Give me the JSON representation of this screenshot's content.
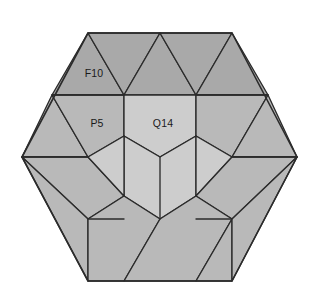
{
  "figure": {
    "kind": "hexagon-tiling-diagram",
    "background_color": "#ffffff",
    "outline_color": "#2b2b2b",
    "width": 318,
    "height": 301
  },
  "palette": {
    "dark_gray": "#a9a9a9",
    "mid_gray": "#b9b9b9",
    "light_gray": "#cdcdcd",
    "stroke": "#2b2b2b"
  },
  "hexagon": {
    "vertices": [
      {
        "x": 22,
        "y": 157
      },
      {
        "x": 88,
        "y": 33
      },
      {
        "x": 232,
        "y": 33
      },
      {
        "x": 297,
        "y": 157
      },
      {
        "x": 232,
        "y": 281
      },
      {
        "x": 88,
        "y": 281
      }
    ]
  },
  "labels": [
    {
      "id": "label-f10",
      "text": "F10",
      "x": 94,
      "y": 74
    },
    {
      "id": "label-p5",
      "text": "P5",
      "x": 97,
      "y": 124
    },
    {
      "id": "label-q14",
      "text": "Q14",
      "x": 163,
      "y": 124
    }
  ],
  "cells": [
    {
      "id": "cell-top-1",
      "name": "top-triangle-left",
      "shade": "dark_gray",
      "points": "88,33 124,95 52,95"
    },
    {
      "id": "cell-top-2",
      "name": "top-triangle-left-center",
      "shade": "dark_gray",
      "points": "88,33 160,33 124,95"
    },
    {
      "id": "cell-top-3",
      "name": "top-triangle-center",
      "shade": "dark_gray",
      "points": "160,33 196,95 124,95"
    },
    {
      "id": "cell-top-4",
      "name": "top-triangle-right-center",
      "shade": "dark_gray",
      "points": "160,33 232,33 196,95"
    },
    {
      "id": "cell-top-5",
      "name": "top-triangle-right",
      "shade": "dark_gray",
      "points": "232,33 268,95 196,95"
    },
    {
      "id": "cell-left-upper-tri",
      "name": "left-upper-triangle",
      "shade": "mid_gray",
      "points": "52,95 88,157 22,157"
    },
    {
      "id": "cell-p5",
      "name": "p5-region",
      "shade": "mid_gray",
      "points": "52,95 124,95 124,136 88,157"
    },
    {
      "id": "cell-q14",
      "name": "q14-region",
      "shade": "light_gray",
      "points": "124,95 196,95 196,136 160,157 124,136"
    },
    {
      "id": "cell-right-upper",
      "name": "right-upper-region",
      "shade": "mid_gray",
      "points": "196,95 268,95 232,157 196,136"
    },
    {
      "id": "cell-right-upper-tri",
      "name": "right-upper-triangle",
      "shade": "mid_gray",
      "points": "268,95 297,157 232,157"
    },
    {
      "id": "cell-center",
      "name": "center-pentagon",
      "shade": "light_gray",
      "points": "124,136 160,157 196,136 196,196 160,219 124,196"
    },
    {
      "id": "cell-left-mid",
      "name": "left-mid-region",
      "shade": "mid_gray",
      "points": "22,157 88,157 124,196 88,219"
    },
    {
      "id": "cell-left-inner",
      "name": "left-inner-region",
      "shade": "light_gray",
      "points": "88,157 124,136 124,196"
    },
    {
      "id": "cell-right-inner",
      "name": "right-inner-region",
      "shade": "light_gray",
      "points": "232,157 196,136 196,196"
    },
    {
      "id": "cell-right-mid",
      "name": "right-mid-region",
      "shade": "mid_gray",
      "points": "232,157 297,157 232,219 196,196"
    },
    {
      "id": "cell-bl-tri",
      "name": "bottom-left-triangle",
      "shade": "mid_gray",
      "points": "22,157 88,219 88,281"
    },
    {
      "id": "cell-b-left",
      "name": "bottom-left-region",
      "shade": "mid_gray",
      "points": "88,219 124,196 160,219 124,281 88,281"
    },
    {
      "id": "cell-b-center",
      "name": "bottom-center-region",
      "shade": "mid_gray",
      "points": "160,219 196,196 232,219 196,281 124,281"
    },
    {
      "id": "cell-br-region",
      "name": "bottom-right-region",
      "shade": "mid_gray",
      "points": "232,219 232,281 196,281"
    },
    {
      "id": "cell-br-tri",
      "name": "bottom-right-triangle",
      "shade": "mid_gray",
      "points": "297,157 232,219 232,281"
    }
  ],
  "edges": [
    {
      "id": "edge-top-band-left",
      "name": "top-horizontal-left",
      "x1": 52,
      "y1": 95,
      "x2": 124,
      "y2": 95
    },
    {
      "id": "edge-top-band-right",
      "name": "top-horizontal-right",
      "x1": 196,
      "y1": 95,
      "x2": 268,
      "y2": 95
    },
    {
      "id": "edge-left-waist",
      "name": "left-horizontal",
      "x1": 22,
      "y1": 157,
      "x2": 88,
      "y2": 157
    },
    {
      "id": "edge-right-waist",
      "name": "right-horizontal",
      "x1": 232,
      "y1": 157,
      "x2": 297,
      "y2": 157
    },
    {
      "id": "edge-bottom-band-left",
      "name": "bottom-horizontal-left",
      "x1": 88,
      "y1": 219,
      "x2": 124,
      "y2": 219
    },
    {
      "id": "edge-bottom-band-right",
      "name": "bottom-horizontal-right",
      "x1": 196,
      "y1": 219,
      "x2": 232,
      "y2": 219
    },
    {
      "id": "edge-center-stem",
      "name": "center-vertical-stem",
      "x1": 160,
      "y1": 157,
      "x2": 160,
      "y2": 219
    }
  ]
}
